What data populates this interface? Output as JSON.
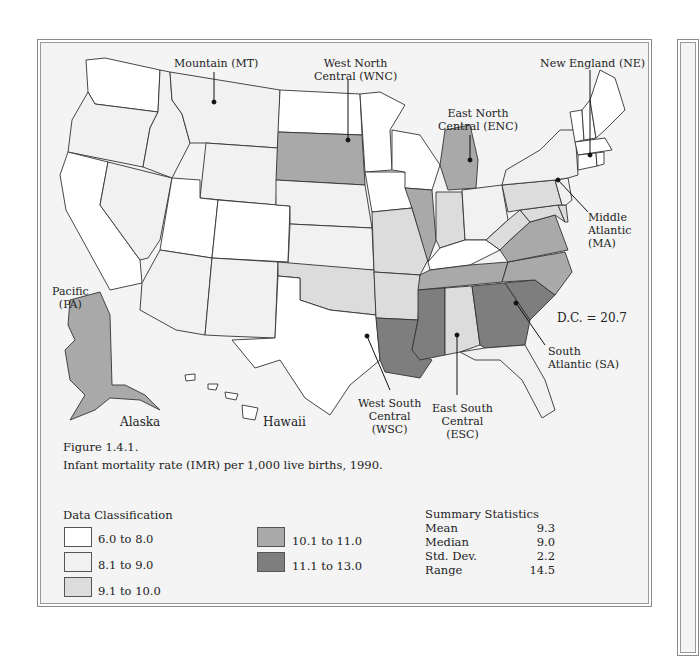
{
  "figure": {
    "number": "Figure 1.4.1.",
    "caption": "Infant mortality rate (IMR) per 1,000 live births, 1990."
  },
  "colors": {
    "c1": "#ffffff",
    "c2": "#f1f1f1",
    "c3": "#dcdcdc",
    "c4": "#a9a9a9",
    "c5": "#7e7e7e",
    "water": "#f4f4f4",
    "border": "#333333"
  },
  "regions": {
    "mountain": "Mountain (MT)",
    "wnc_1": "West North",
    "wnc_2": "Central (WNC)",
    "enc_1": "East North",
    "enc_2": "Central (ENC)",
    "ne": "New England (NE)",
    "ma_1": "Middle",
    "ma_2": "Atlantic",
    "ma_3": "(MA)",
    "pa_1": "Pacific",
    "pa_2": "(PA)",
    "dc": "D.C. = 20.7",
    "sa_1": "South",
    "sa_2": "Atlantic (SA)",
    "wsc_1": "West South",
    "wsc_2": "Central",
    "wsc_3": "(WSC)",
    "esc_1": "East South",
    "esc_2": "Central",
    "esc_3": "(ESC)",
    "alaska": "Alaska",
    "hawaii": "Hawaii"
  },
  "legend": {
    "title": "Data Classification",
    "items": [
      {
        "label": "6.0 to 8.0",
        "color": "#ffffff"
      },
      {
        "label": "8.1 to 9.0",
        "color": "#f1f1f1"
      },
      {
        "label": "9.1 to 10.0",
        "color": "#dcdcdc"
      },
      {
        "label": "10.1 to 11.0",
        "color": "#a9a9a9"
      },
      {
        "label": "11.1 to 13.0",
        "color": "#7e7e7e"
      }
    ]
  },
  "summary": {
    "title": "Summary Statistics",
    "rows": [
      {
        "key": "Mean",
        "value": "9.3"
      },
      {
        "key": "Median",
        "value": "9.0"
      },
      {
        "key": "Std. Dev.",
        "value": "2.2"
      },
      {
        "key": "Range",
        "value": "14.5"
      }
    ]
  }
}
